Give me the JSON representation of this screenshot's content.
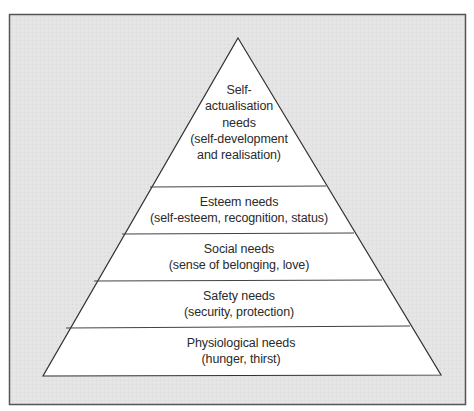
{
  "diagram": {
    "type": "pyramid",
    "colors": {
      "background": "#e6e6e6",
      "frame_border": "#555555",
      "pyramid_fill": "#ffffff",
      "pyramid_stroke": "#333333",
      "text": "#2a2a2a"
    },
    "levels": [
      {
        "id": "self-actualisation",
        "title_lines": [
          "Self-",
          "actualisation",
          "needs"
        ],
        "detail_lines": [
          "(self-development",
          "and realisation)"
        ]
      },
      {
        "id": "esteem",
        "title_lines": [
          "Esteem needs"
        ],
        "detail_lines": [
          "(self-esteem, recognition, status)"
        ]
      },
      {
        "id": "social",
        "title_lines": [
          "Social needs"
        ],
        "detail_lines": [
          "(sense of belonging, love)"
        ]
      },
      {
        "id": "safety",
        "title_lines": [
          "Safety needs"
        ],
        "detail_lines": [
          "(security, protection)"
        ]
      },
      {
        "id": "physiological",
        "title_lines": [
          "Physiological needs"
        ],
        "detail_lines": [
          "(hunger, thirst)"
        ]
      }
    ]
  }
}
